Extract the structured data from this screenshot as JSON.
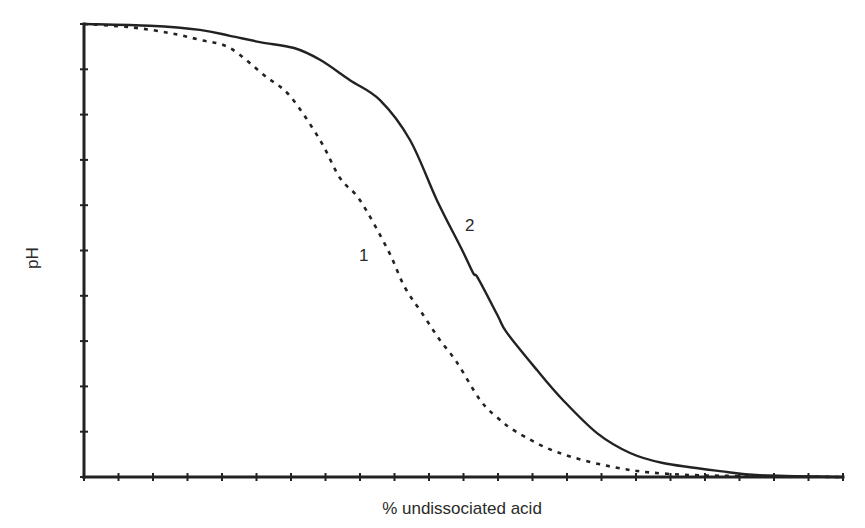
{
  "chart_data": {
    "type": "line",
    "title": "",
    "xlabel": "% undissociated acid",
    "ylabel": "pH",
    "xlim": [
      0,
      22
    ],
    "ylim": [
      0,
      10
    ],
    "x_ticks_count": 23,
    "y_ticks_count": 11,
    "tick_labels_shown": false,
    "grid": false,
    "legend": "none (curves labeled inline)",
    "units_note": "No numeric tick labels are shown; values are in tick-mark units (x: 0-22 ticks, y: 0-10 ticks).",
    "series": [
      {
        "name": "1",
        "style": "dashed",
        "label_position": {
          "x": 8.3,
          "y": 5.2
        },
        "points": [
          [
            0,
            10
          ],
          [
            1.33,
            9.93
          ],
          [
            2.49,
            9.8
          ],
          [
            3.36,
            9.65
          ],
          [
            4.23,
            9.47
          ],
          [
            5.22,
            8.87
          ],
          [
            5.97,
            8.41
          ],
          [
            6.84,
            7.44
          ],
          [
            7.42,
            6.6
          ],
          [
            8.0,
            6.11
          ],
          [
            8.81,
            5.01
          ],
          [
            9.29,
            4.2
          ],
          [
            9.83,
            3.58
          ],
          [
            10.32,
            3.02
          ],
          [
            10.81,
            2.53
          ],
          [
            11.48,
            1.7
          ],
          [
            11.97,
            1.32
          ],
          [
            12.55,
            0.99
          ],
          [
            13.71,
            0.55
          ],
          [
            15.33,
            0.22
          ],
          [
            16.9,
            0.07
          ],
          [
            19.01,
            0.02
          ],
          [
            22,
            0
          ]
        ]
      },
      {
        "name": "2",
        "style": "solid",
        "label_position": {
          "x": 11.1,
          "y": 5.7
        },
        "points": [
          [
            0,
            10
          ],
          [
            1.91,
            9.96
          ],
          [
            3.36,
            9.87
          ],
          [
            4.23,
            9.74
          ],
          [
            5.1,
            9.6
          ],
          [
            6.09,
            9.47
          ],
          [
            6.84,
            9.21
          ],
          [
            7.71,
            8.76
          ],
          [
            8.58,
            8.32
          ],
          [
            9.45,
            7.44
          ],
          [
            10.23,
            6.11
          ],
          [
            10.96,
            5.01
          ],
          [
            11.28,
            4.5
          ],
          [
            11.42,
            4.39
          ],
          [
            12.0,
            3.55
          ],
          [
            12.26,
            3.18
          ],
          [
            13.13,
            2.36
          ],
          [
            13.88,
            1.7
          ],
          [
            14.87,
            0.97
          ],
          [
            15.83,
            0.53
          ],
          [
            16.78,
            0.31
          ],
          [
            18.43,
            0.13
          ],
          [
            19.59,
            0.04
          ],
          [
            22,
            0
          ]
        ]
      }
    ]
  },
  "labels": {
    "xlabel": "% undissociated acid",
    "ylabel": "pH",
    "curve1": "1",
    "curve2": "2"
  },
  "colors": {
    "ink": "#222222",
    "background": "#ffffff"
  }
}
